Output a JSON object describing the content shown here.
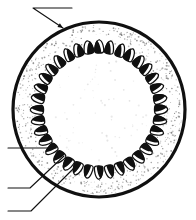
{
  "figure": {
    "caption": "",
    "background_color": "#ffffff",
    "ink_color": "#101010",
    "width": 196,
    "height": 220
  },
  "outer_wall": {
    "name": "ovary-wall",
    "label": "",
    "center_x": 99,
    "center_y": 109.5,
    "radius_x": 86,
    "radius_y": 87.5,
    "stroke_color": "#101010",
    "stroke_width": 3.2,
    "fill_color": "#ffffff"
  },
  "stipple_band": {
    "name": "pericarp-stipple-band",
    "outer_radius_x": 83,
    "outer_radius_y": 84.5,
    "inner_radius_x": 57,
    "inner_radius_y": 58,
    "dot_color": "#7a7a7a",
    "dot_count": 620,
    "description": "speckled tissue between ovary wall and ovule ring"
  },
  "inner_cavity": {
    "name": "locule-cavity",
    "radius_x": 50,
    "radius_y": 51,
    "fill_color": "#ffffff",
    "faint_dot_count": 70,
    "faint_dot_color": "#dcdcdc"
  },
  "ovule_ring": {
    "name": "ovule-ring",
    "count": 36,
    "ring_radius_x": 62,
    "ring_radius_y": 63,
    "seed_length": 13.5,
    "seed_width": 9.5,
    "body_fill": "#ffffff",
    "body_stroke": "#101010",
    "body_stroke_width": 1.25,
    "cap_fill": "#101010",
    "start_angle_deg": -90,
    "description": "teardrop ovules, each with solid black wedge on outward-facing side"
  },
  "leaders": [
    {
      "name": "leader-ovary-wall",
      "label": "",
      "elbow_x": 33,
      "elbow_y": 8,
      "tail_x": 72,
      "tail_y": 8,
      "tip_x": 63,
      "tip_y": 28,
      "arrow": true
    },
    {
      "name": "leader-ovule-upper",
      "label": "",
      "elbow_x": 8,
      "elbow_y": 148,
      "tail_x": 8,
      "tail_y": 148,
      "tip_x": 56,
      "tip_y": 148,
      "arrow": false
    },
    {
      "name": "leader-ovule-middle",
      "label": "",
      "elbow_x": 30,
      "elbow_y": 188,
      "tail_x": 8,
      "tail_y": 188,
      "tip_x": 64,
      "tip_y": 156,
      "arrow": false
    },
    {
      "name": "leader-placenta",
      "label": "",
      "elbow_x": 31,
      "elbow_y": 211,
      "tail_x": 8,
      "tail_y": 211,
      "tip_x": 79,
      "tip_y": 163,
      "arrow": false
    }
  ]
}
